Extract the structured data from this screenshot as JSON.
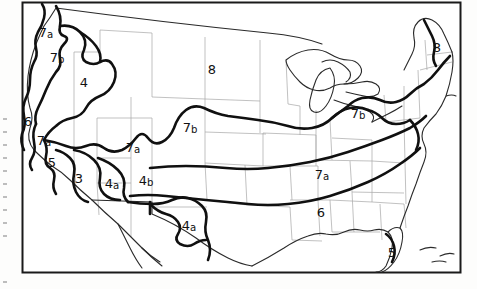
{
  "figure": {
    "kind": "scanned-map",
    "background_color": "#fdfdfc",
    "ink_color": "#111111",
    "state_border_color": "#9a9a9a",
    "frame_color": "#1a1a1a"
  },
  "frame": {
    "left": 22,
    "top": 2,
    "right": 461,
    "bottom": 273,
    "stroke_width": 2
  },
  "zone_labels": [
    {
      "id": "zone-7a-pacific-northwest",
      "text": "7",
      "sub": "a",
      "x": 46,
      "y": 33,
      "size": 13
    },
    {
      "id": "zone-7b-washington",
      "text": "7",
      "sub": "b",
      "x": 57,
      "y": 58,
      "size": 13
    },
    {
      "id": "zone-4-idaho",
      "text": "4",
      "sub": "",
      "x": 84,
      "y": 83,
      "size": 13
    },
    {
      "id": "zone-8-northern-plains",
      "text": "8",
      "sub": "",
      "x": 212,
      "y": 70,
      "size": 13
    },
    {
      "id": "zone-8-maine",
      "text": "8",
      "sub": "",
      "x": 437,
      "y": 48,
      "size": 13
    },
    {
      "id": "zone-6-northern-california",
      "text": "6",
      "sub": "",
      "x": 28,
      "y": 122,
      "size": 13
    },
    {
      "id": "zone-7a-california-coast",
      "text": "7",
      "sub": "a",
      "x": 44,
      "y": 141,
      "size": 13
    },
    {
      "id": "zone-7b-central-plains",
      "text": "7",
      "sub": "b",
      "x": 190,
      "y": 128,
      "size": 13
    },
    {
      "id": "zone-7b-ohio-valley",
      "text": "7",
      "sub": "b",
      "x": 358,
      "y": 114,
      "size": 13
    },
    {
      "id": "zone-7a-great-basin",
      "text": "7",
      "sub": "a",
      "x": 133,
      "y": 148,
      "size": 13
    },
    {
      "id": "zone-5-southern-california",
      "text": "5",
      "sub": "",
      "x": 52,
      "y": 163,
      "size": 13
    },
    {
      "id": "zone-3-desert-southwest",
      "text": "3",
      "sub": "",
      "x": 79,
      "y": 179,
      "size": 13
    },
    {
      "id": "zone-4a-arizona",
      "text": "4",
      "sub": "a",
      "x": 112,
      "y": 184,
      "size": 13
    },
    {
      "id": "zone-4b-new-mexico",
      "text": "4",
      "sub": "b",
      "x": 146,
      "y": 181,
      "size": 13
    },
    {
      "id": "zone-4a-texas",
      "text": "4",
      "sub": "a",
      "x": 189,
      "y": 226,
      "size": 13
    },
    {
      "id": "zone-7a-southeast",
      "text": "7",
      "sub": "a",
      "x": 322,
      "y": 175,
      "size": 13
    },
    {
      "id": "zone-6-gulf-coast",
      "text": "6",
      "sub": "",
      "x": 321,
      "y": 213,
      "size": 13
    },
    {
      "id": "zone-5-florida",
      "text": "5",
      "sub": "",
      "x": 392,
      "y": 253,
      "size": 13
    }
  ],
  "edge_marks": {
    "present": true,
    "count": 11,
    "color": "#b9b9b9",
    "note": "faint scanner/punch artifacts down the left page margin"
  }
}
